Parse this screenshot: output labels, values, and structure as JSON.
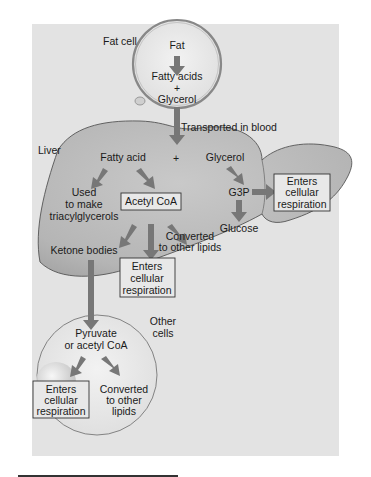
{
  "diagram": {
    "colors": {
      "panel": "#e3e3e3",
      "liver": "#bdbdbd",
      "cell": "#ececec",
      "arrow": "#777777",
      "text": "#1a1a1a"
    },
    "fat_cell": {
      "label": "Fat cell",
      "fat": "Fat",
      "fatty_acids": "Fatty acids",
      "plus": "+",
      "glycerol": "Glycerol"
    },
    "transport_label": "Transported in blood",
    "liver": {
      "label": "Liver",
      "fatty_acid": "Fatty acid",
      "plus": "+",
      "glycerol": "Glycerol",
      "used_line1": "Used",
      "used_line2": "to make",
      "used_line3": "triacylglycerols",
      "acetyl_coa": "Acetyl CoA",
      "converted_line1": "Converted",
      "converted_line2": "to other lipids",
      "ketone_bodies": "Ketone bodies",
      "g3p": "G3P",
      "glucose": "Glucose",
      "enters_g3p": [
        "Enters",
        "cellular",
        "respiration"
      ],
      "enters_acetyl": [
        "Enters",
        "cellular",
        "respiration"
      ]
    },
    "other_cells": {
      "label_line1": "Other",
      "label_line2": "cells",
      "pyruvate_line1": "Pyruvate",
      "pyruvate_line2": "or acetyl CoA",
      "enters": [
        "Enters",
        "cellular",
        "respiration"
      ],
      "converted": [
        "Converted",
        "to other",
        "lipids"
      ]
    }
  }
}
